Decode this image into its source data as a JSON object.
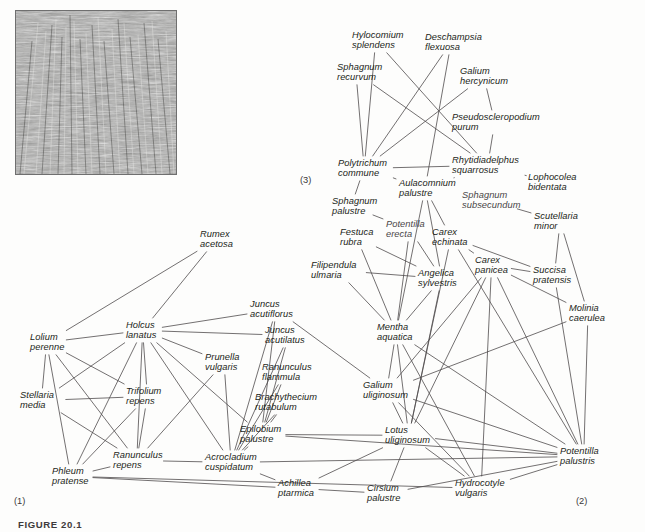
{
  "figure": {
    "caption": "FIGURE 20.1",
    "photo_alt": "grass-vegetation-photograph"
  },
  "cluster_tags": [
    {
      "label": "(1)",
      "x": 14,
      "y": 496
    },
    {
      "label": "(2)",
      "x": 576,
      "y": 496
    },
    {
      "label": "(3)",
      "x": 300,
      "y": 175
    }
  ],
  "nodes": [
    {
      "id": "rumex_acetosa",
      "label": "Rumex\nacetosa",
      "x": 200,
      "y": 229,
      "anchor": "start"
    },
    {
      "id": "hylocomium_splendens",
      "label": "Hylocomium\nsplendens",
      "x": 352,
      "y": 30,
      "anchor": "start"
    },
    {
      "id": "deschampsia_flexuosa",
      "label": "Deschampsia\nflexuosa",
      "x": 425,
      "y": 32,
      "anchor": "start"
    },
    {
      "id": "sphagnum_recurvum",
      "label": "Sphagnum\nrecurvum",
      "x": 337,
      "y": 62,
      "anchor": "start"
    },
    {
      "id": "galium_hercynicum",
      "label": "Galium\nhercynicum",
      "x": 460,
      "y": 66,
      "anchor": "start"
    },
    {
      "id": "pseudoscleropodium_purum",
      "label": "Pseudoscleropodium\npurum",
      "x": 452,
      "y": 112,
      "anchor": "start"
    },
    {
      "id": "polytrichum_commune",
      "label": "Polytrichum\ncommune",
      "x": 338,
      "y": 158,
      "anchor": "start"
    },
    {
      "id": "rhytidiadelphus_squarrosus",
      "label": "Rhytidiadelphus\nsquarrosus",
      "x": 452,
      "y": 155,
      "anchor": "start"
    },
    {
      "id": "lophocolea_bidentata",
      "label": "Lophocolea\nbidentata",
      "x": 528,
      "y": 172,
      "anchor": "start"
    },
    {
      "id": "aulacomnium_palustre",
      "label": "Aulacomnium\npalustre",
      "x": 399,
      "y": 178,
      "anchor": "start"
    },
    {
      "id": "sphagnum_subsecundum",
      "label": "Sphagnum\nsubsecundum",
      "x": 462,
      "y": 190,
      "anchor": "start",
      "faint": true
    },
    {
      "id": "sphagnum_palustre",
      "label": "Sphagnum\npalustre",
      "x": 332,
      "y": 196,
      "anchor": "start"
    },
    {
      "id": "scutellaria_minor",
      "label": "Scutellaria\nminor",
      "x": 534,
      "y": 211,
      "anchor": "start"
    },
    {
      "id": "potentilla_erecta",
      "label": "Potentilla\nerecta",
      "x": 386,
      "y": 219,
      "anchor": "start",
      "faint": true
    },
    {
      "id": "festuca_rubra",
      "label": "Festuca\nrubra",
      "x": 340,
      "y": 227,
      "anchor": "start"
    },
    {
      "id": "carex_echinata",
      "label": "Carex\nechinata",
      "x": 432,
      "y": 227,
      "anchor": "start"
    },
    {
      "id": "filipendula_ulmaria",
      "label": "Filipendula\nulmaria",
      "x": 311,
      "y": 260,
      "anchor": "start"
    },
    {
      "id": "carex_panicea",
      "label": "Carex\npanicea",
      "x": 475,
      "y": 255,
      "anchor": "start"
    },
    {
      "id": "succisa_pratensis",
      "label": "Succisa\npratensis",
      "x": 533,
      "y": 265,
      "anchor": "start"
    },
    {
      "id": "angelica_sylvestris",
      "label": "Angelica\nsylvestris",
      "x": 418,
      "y": 268,
      "anchor": "start"
    },
    {
      "id": "molinia_caerulea",
      "label": "Molinia\ncaerulea",
      "x": 569,
      "y": 303,
      "anchor": "start"
    },
    {
      "id": "juncus_acutiflorus",
      "label": "Juncus\nacutiflorus",
      "x": 250,
      "y": 299,
      "anchor": "start"
    },
    {
      "id": "holcus_lanatus",
      "label": "Holcus\nlanatus",
      "x": 126,
      "y": 320,
      "anchor": "start"
    },
    {
      "id": "juncus_acutilatus",
      "label": "Juncus\nacutilatus",
      "x": 265,
      "y": 325,
      "anchor": "start"
    },
    {
      "id": "mentha_aquatica",
      "label": "Mentha\naquatica",
      "x": 377,
      "y": 322,
      "anchor": "start"
    },
    {
      "id": "lolium_perenne",
      "label": "Lolium\nperenne",
      "x": 30,
      "y": 332,
      "anchor": "start"
    },
    {
      "id": "prunella_vulgaris",
      "label": "Prunella\nvulgaris",
      "x": 205,
      "y": 352,
      "anchor": "start"
    },
    {
      "id": "ranunculus_flammula",
      "label": "Ranunculus\nflammula",
      "x": 262,
      "y": 362,
      "anchor": "start"
    },
    {
      "id": "trifolium_repens",
      "label": "Trifolium\nrepens",
      "x": 126,
      "y": 386,
      "anchor": "start"
    },
    {
      "id": "galium_uliginosum",
      "label": "Galium\nuliginosum",
      "x": 363,
      "y": 380,
      "anchor": "start"
    },
    {
      "id": "stellaria_media",
      "label": "Stellaria\nmedia",
      "x": 20,
      "y": 390,
      "anchor": "start"
    },
    {
      "id": "brachythecium_rutabulum",
      "label": "Brachythecium\nrutabulum",
      "x": 255,
      "y": 392,
      "anchor": "start"
    },
    {
      "id": "epilobium_palustre",
      "label": "Epilobium\npalustre",
      "x": 240,
      "y": 424,
      "anchor": "start"
    },
    {
      "id": "lotus_uliginosum",
      "label": "Lotus\nuliginosum",
      "x": 385,
      "y": 425,
      "anchor": "start"
    },
    {
      "id": "ranunculus_repens",
      "label": "Ranunculus\nrepens",
      "x": 113,
      "y": 450,
      "anchor": "start"
    },
    {
      "id": "acrocladium_cuspidatum",
      "label": "Acrocladium\ncuspidatum",
      "x": 205,
      "y": 452,
      "anchor": "start"
    },
    {
      "id": "potentilla_palustris",
      "label": "Potentilla\npalustris",
      "x": 560,
      "y": 446,
      "anchor": "start"
    },
    {
      "id": "phleum_pratense",
      "label": "Phleum\npratense",
      "x": 52,
      "y": 466,
      "anchor": "start"
    },
    {
      "id": "achillea_ptarmica",
      "label": "Achillea\nptarmica",
      "x": 278,
      "y": 478,
      "anchor": "start"
    },
    {
      "id": "cirsium_palustre",
      "label": "Cirsium\npalustre",
      "x": 367,
      "y": 483,
      "anchor": "start"
    },
    {
      "id": "hydrocotyle_vulgaris",
      "label": "Hydrocotyle\nvulgaris",
      "x": 455,
      "y": 478,
      "anchor": "start"
    }
  ],
  "network": {
    "type": "undirected-graph",
    "line_color": "#4f4b4c",
    "line_width": 0.8,
    "edges": [
      [
        "hylocomium_splendens",
        "polytrichum_commune"
      ],
      [
        "hylocomium_splendens",
        "rhytidiadelphus_squarrosus"
      ],
      [
        "deschampsia_flexuosa",
        "polytrichum_commune"
      ],
      [
        "deschampsia_flexuosa",
        "aulacomnium_palustre"
      ],
      [
        "sphagnum_recurvum",
        "polytrichum_commune"
      ],
      [
        "sphagnum_recurvum",
        "rhytidiadelphus_squarrosus"
      ],
      [
        "galium_hercynicum",
        "pseudoscleropodium_purum"
      ],
      [
        "galium_hercynicum",
        "polytrichum_commune"
      ],
      [
        "pseudoscleropodium_purum",
        "rhytidiadelphus_squarrosus"
      ],
      [
        "polytrichum_commune",
        "rhytidiadelphus_squarrosus"
      ],
      [
        "polytrichum_commune",
        "sphagnum_palustre"
      ],
      [
        "polytrichum_commune",
        "aulacomnium_palustre"
      ],
      [
        "rhytidiadelphus_squarrosus",
        "aulacomnium_palustre"
      ],
      [
        "rhytidiadelphus_squarrosus",
        "lophocolea_bidentata"
      ],
      [
        "aulacomnium_palustre",
        "carex_echinata"
      ],
      [
        "aulacomnium_palustre",
        "angelica_sylvestris"
      ],
      [
        "aulacomnium_palustre",
        "mentha_aquatica"
      ],
      [
        "sphagnum_subsecundum",
        "scutellaria_minor"
      ],
      [
        "sphagnum_palustre",
        "potentilla_erecta"
      ],
      [
        "scutellaria_minor",
        "succisa_pratensis"
      ],
      [
        "scutellaria_minor",
        "molinia_caerulea"
      ],
      [
        "potentilla_erecta",
        "angelica_sylvestris"
      ],
      [
        "festuca_rubra",
        "angelica_sylvestris"
      ],
      [
        "carex_echinata",
        "carex_panicea"
      ],
      [
        "carex_echinata",
        "lotus_uliginosum"
      ],
      [
        "carex_echinata",
        "potentilla_palustris"
      ],
      [
        "filipendula_ulmaria",
        "mentha_aquatica"
      ],
      [
        "carex_panicea",
        "succisa_pratensis"
      ],
      [
        "carex_panicea",
        "molinia_caerulea"
      ],
      [
        "carex_panicea",
        "lotus_uliginosum"
      ],
      [
        "carex_panicea",
        "potentilla_palustris"
      ],
      [
        "carex_panicea",
        "hydrocotyle_vulgaris"
      ],
      [
        "succisa_pratensis",
        "potentilla_palustris"
      ],
      [
        "angelica_sylvestris",
        "mentha_aquatica"
      ],
      [
        "angelica_sylvestris",
        "lotus_uliginosum"
      ],
      [
        "molinia_caerulea",
        "potentilla_palustris"
      ],
      [
        "juncus_acutiflorus",
        "holcus_lanatus"
      ],
      [
        "juncus_acutiflorus",
        "epilobium_palustre"
      ],
      [
        "juncus_acutiflorus",
        "acrocladium_cuspidatum"
      ],
      [
        "juncus_acutiflorus",
        "galium_uliginosum"
      ],
      [
        "holcus_lanatus",
        "lolium_perenne"
      ],
      [
        "holcus_lanatus",
        "trifolium_repens"
      ],
      [
        "holcus_lanatus",
        "stellaria_media"
      ],
      [
        "holcus_lanatus",
        "ranunculus_repens"
      ],
      [
        "holcus_lanatus",
        "phleum_pratense"
      ],
      [
        "holcus_lanatus",
        "prunella_vulgaris"
      ],
      [
        "holcus_lanatus",
        "juncus_acutilatus"
      ],
      [
        "holcus_lanatus",
        "epilobium_palustre"
      ],
      [
        "holcus_lanatus",
        "acrocladium_cuspidatum"
      ],
      [
        "holcus_lanatus",
        "rumex_acetosa"
      ],
      [
        "juncus_acutilatus",
        "epilobium_palustre"
      ],
      [
        "juncus_acutilatus",
        "acrocladium_cuspidatum"
      ],
      [
        "mentha_aquatica",
        "galium_uliginosum"
      ],
      [
        "mentha_aquatica",
        "lotus_uliginosum"
      ],
      [
        "mentha_aquatica",
        "potentilla_palustris"
      ],
      [
        "lolium_perenne",
        "stellaria_media"
      ],
      [
        "lolium_perenne",
        "trifolium_repens"
      ],
      [
        "lolium_perenne",
        "ranunculus_repens"
      ],
      [
        "lolium_perenne",
        "phleum_pratense"
      ],
      [
        "prunella_vulgaris",
        "ranunculus_repens"
      ],
      [
        "prunella_vulgaris",
        "acrocladium_cuspidatum"
      ],
      [
        "ranunculus_flammula",
        "epilobium_palustre"
      ],
      [
        "ranunculus_flammula",
        "acrocladium_cuspidatum"
      ],
      [
        "trifolium_repens",
        "ranunculus_repens"
      ],
      [
        "trifolium_repens",
        "phleum_pratense"
      ],
      [
        "trifolium_repens",
        "stellaria_media"
      ],
      [
        "galium_uliginosum",
        "lotus_uliginosum"
      ],
      [
        "galium_uliginosum",
        "potentilla_palustris"
      ],
      [
        "galium_uliginosum",
        "hydrocotyle_vulgaris"
      ],
      [
        "stellaria_media",
        "ranunculus_repens"
      ],
      [
        "brachythecium_rutabulum",
        "epilobium_palustre"
      ],
      [
        "brachythecium_rutabulum",
        "acrocladium_cuspidatum"
      ],
      [
        "epilobium_palustre",
        "acrocladium_cuspidatum"
      ],
      [
        "epilobium_palustre",
        "lotus_uliginosum"
      ],
      [
        "epilobium_palustre",
        "potentilla_palustris"
      ],
      [
        "lotus_uliginosum",
        "potentilla_palustris"
      ],
      [
        "lotus_uliginosum",
        "cirsium_palustre"
      ],
      [
        "lotus_uliginosum",
        "hydrocotyle_vulgaris"
      ],
      [
        "lotus_uliginosum",
        "achillea_ptarmica"
      ],
      [
        "ranunculus_repens",
        "phleum_pratense"
      ],
      [
        "ranunculus_repens",
        "acrocladium_cuspidatum"
      ],
      [
        "acrocladium_cuspidatum",
        "achillea_ptarmica"
      ],
      [
        "acrocladium_cuspidatum",
        "potentilla_palustris"
      ],
      [
        "potentilla_palustris",
        "hydrocotyle_vulgaris"
      ],
      [
        "potentilla_palustris",
        "cirsium_palustre"
      ],
      [
        "phleum_pratense",
        "achillea_ptarmica"
      ],
      [
        "phleum_pratense",
        "hydrocotyle_vulgaris"
      ],
      [
        "achillea_ptarmica",
        "cirsium_palustre"
      ],
      [
        "rumex_acetosa",
        "lolium_perenne"
      ],
      [
        "potentilla_erecta",
        "mentha_aquatica"
      ],
      [
        "festuca_rubra",
        "mentha_aquatica"
      ],
      [
        "filipendula_ulmaria",
        "angelica_sylvestris"
      ],
      [
        "carex_echinata",
        "succisa_pratensis"
      ],
      [
        "galium_uliginosum",
        "carex_panicea"
      ],
      [
        "mentha_aquatica",
        "hydrocotyle_vulgaris"
      ],
      [
        "galium_uliginosum",
        "molinia_caerulea"
      ]
    ]
  }
}
